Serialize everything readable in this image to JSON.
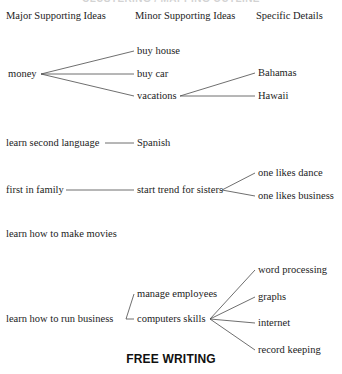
{
  "cropped_title": "CLUSTERING / MAPPING OUTLINE",
  "headers": {
    "major": "Major Supporting Ideas",
    "minor": "Minor Supporting Ideas",
    "detail": "Specific Details"
  },
  "footer": {
    "caption": "FREE WRITING"
  },
  "nodes": {
    "money": "money",
    "buy_house": "buy house",
    "buy_car": "buy car",
    "vacations": "vacations",
    "bahamas": "Bahamas",
    "hawaii": "Hawaii",
    "learn_second_language": "learn second language",
    "spanish": "Spanish",
    "first_in_family": "first in family",
    "start_trend_for_sisters": "start trend for sisters",
    "one_likes_dance": "one likes dance",
    "one_likes_business": "one likes business",
    "learn_how_to_make_movies": "learn how to make movies",
    "learn_how_to_run_business": "learn how to run business",
    "manage_employees": "manage employees",
    "computers_skills": "computers skills",
    "word_processing": "word processing",
    "graphs": "graphs",
    "internet": "internet",
    "record_keeping": "record keeping"
  },
  "colors": {
    "text": "#1c1c1c",
    "line": "#4a4a4a",
    "background": "#ffffff"
  }
}
